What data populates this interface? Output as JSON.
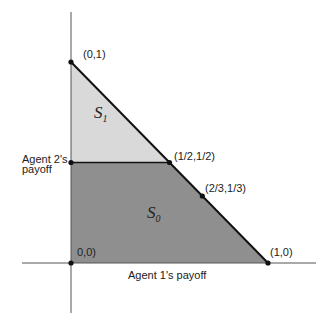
{
  "diagram": {
    "type": "payoff-region",
    "x_axis_label": "Agent 1's payoff",
    "y_axis_label_line1": "Agent 2's",
    "y_axis_label_line2": "payoff",
    "points": [
      {
        "id": "origin",
        "label": "0,0)",
        "x": 0,
        "y": 0
      },
      {
        "id": "p01",
        "label": "(0,1)",
        "x": 0,
        "y": 1
      },
      {
        "id": "p10",
        "label": "(1,0)",
        "x": 1,
        "y": 0
      },
      {
        "id": "phalf",
        "label": "(1/2,1/2)",
        "x": 0.5,
        "y": 0.5
      },
      {
        "id": "p2313",
        "label": "(2/3,1/3)",
        "x": 0.6667,
        "y": 0.3333
      }
    ],
    "regions": [
      {
        "id": "S1",
        "name": "S",
        "subscript": "1",
        "color": "#d9d9d9"
      },
      {
        "id": "S0",
        "name": "S",
        "subscript": "0",
        "color": "#8f8f8f"
      }
    ]
  }
}
